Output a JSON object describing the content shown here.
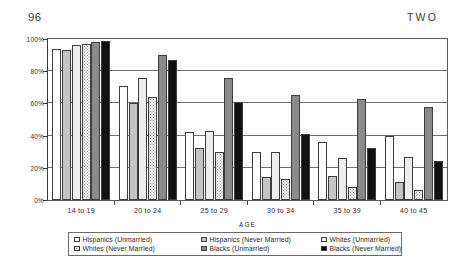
{
  "page": {
    "folio": "96",
    "running_head": "TWO"
  },
  "chart_data": {
    "type": "bar",
    "title": "",
    "xlabel": "AGE",
    "ylabel": "",
    "ylim": [
      0,
      100
    ],
    "grid": true,
    "legend_position": "bottom",
    "categories": [
      "14 to 19",
      "20 to 24",
      "25 to 29",
      "30 to 34",
      "35 to 39",
      "40 to 45"
    ],
    "y_ticks": [
      "0%",
      "20%",
      "40%",
      "60%",
      "80%",
      "100%"
    ],
    "y_tick_values": [
      0,
      20,
      40,
      60,
      80,
      100
    ],
    "series": [
      {
        "name": "Hispanics (Unmarried)",
        "swatch": "sw-hisp-unm",
        "color": "#ffffff",
        "values": [
          94,
          71,
          42,
          30,
          36,
          40
        ]
      },
      {
        "name": "Hispanics (Never Married)",
        "swatch": "sw-hisp-nev",
        "color": "#c4c4c4",
        "values": [
          93,
          60,
          32,
          14,
          15,
          11
        ]
      },
      {
        "name": "Whites (Unmarried)",
        "swatch": "sw-whit-unm",
        "color": "#ededed",
        "values": [
          96,
          76,
          43,
          30,
          26,
          27
        ]
      },
      {
        "name": "Whites (Never Married)",
        "swatch": "sw-whit-nev",
        "color": "#fbfbfb",
        "values": [
          97,
          64,
          30,
          13,
          8,
          6
        ]
      },
      {
        "name": "Blacks (Unmarried)",
        "swatch": "sw-blac-unm",
        "color": "#8a8a8a",
        "values": [
          98,
          90,
          76,
          65,
          63,
          58
        ]
      },
      {
        "name": "Blacks (Never Married)",
        "swatch": "sw-blac-nev",
        "color": "#111111",
        "values": [
          99,
          87,
          61,
          41,
          32,
          24
        ]
      }
    ]
  }
}
